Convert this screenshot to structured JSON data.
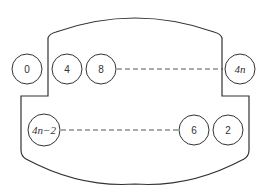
{
  "diagram": {
    "type": "round-table seating arrangement",
    "stroke_color": "#333333",
    "top_row": {
      "outside_left": {
        "label": "0"
      },
      "inside": [
        {
          "label": "4"
        },
        {
          "label": "8"
        }
      ],
      "ellipsis": "dashed line",
      "outside_right": {
        "label": "4n"
      }
    },
    "bottom_row": {
      "inside_left": {
        "label": "4n−2"
      },
      "ellipsis": "dashed line",
      "inside": [
        {
          "label": "6"
        },
        {
          "label": "2"
        }
      ]
    }
  }
}
